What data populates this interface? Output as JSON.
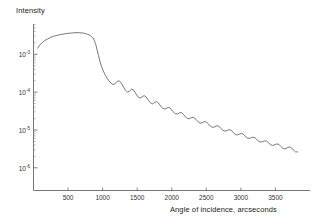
{
  "chart_data": {
    "type": "line",
    "title": "",
    "ylabel": "Intensity",
    "xlabel": "Angle of incidence, arcseconds",
    "xlim": [
      0,
      4000
    ],
    "ylim_log10": [
      -6.6,
      -2.2
    ],
    "grid": false,
    "legend": null,
    "xticks": [
      500,
      1000,
      1500,
      2000,
      2500,
      3000,
      3500
    ],
    "xtick_labels": [
      "500",
      "1000",
      "1500",
      "2000",
      "2500",
      "3000",
      "3500"
    ],
    "yticks_log10": [
      -3,
      -4,
      -5,
      -6
    ],
    "ytick_mantissa": "10",
    "ytick_exponents": [
      "-3",
      "-4",
      "-5",
      "-6"
    ],
    "y_scale": "log",
    "minor_ticks": "log-decade",
    "series": [
      {
        "name": "X-ray reflectivity",
        "color": "#555555",
        "description": "Plateau of total external reflection up to the critical angle near 900 arcsec, then a steep fall-off with regular Kiessig interference fringes decaying toward 4000 arcsec.",
        "x": [
          60,
          90,
          120,
          160,
          200,
          250,
          300,
          360,
          420,
          480,
          540,
          600,
          660,
          720,
          780,
          820,
          860,
          880,
          900,
          920,
          940,
          960,
          980,
          1000,
          1030,
          1060,
          1090,
          1120,
          1150,
          1180,
          1210,
          1240,
          1270,
          1300,
          1330,
          1360,
          1390,
          1420,
          1450,
          1480,
          1510,
          1540,
          1570,
          1600,
          1630,
          1660,
          1690,
          1720,
          1750,
          1780,
          1810,
          1840,
          1870,
          1900,
          1930,
          1960,
          1990,
          2020,
          2050,
          2080,
          2110,
          2140,
          2170,
          2200,
          2230,
          2260,
          2290,
          2320,
          2350,
          2380,
          2410,
          2440,
          2470,
          2500,
          2530,
          2560,
          2590,
          2620,
          2650,
          2680,
          2710,
          2740,
          2770,
          2800,
          2830,
          2860,
          2890,
          2920,
          2950,
          2980,
          3010,
          3040,
          3070,
          3100,
          3130,
          3160,
          3190,
          3220,
          3250,
          3280,
          3310,
          3340,
          3370,
          3400,
          3430,
          3460,
          3490,
          3520,
          3550,
          3580,
          3610,
          3640,
          3670,
          3700,
          3730,
          3760,
          3790,
          3820
        ],
        "y_log10": [
          -2.84,
          -2.76,
          -2.7,
          -2.64,
          -2.6,
          -2.55,
          -2.52,
          -2.49,
          -2.47,
          -2.45,
          -2.44,
          -2.43,
          -2.43,
          -2.44,
          -2.47,
          -2.5,
          -2.57,
          -2.64,
          -2.74,
          -2.88,
          -3.03,
          -3.18,
          -3.3,
          -3.4,
          -3.52,
          -3.62,
          -3.7,
          -3.76,
          -3.8,
          -3.78,
          -3.72,
          -3.7,
          -3.76,
          -3.86,
          -3.95,
          -4.0,
          -3.97,
          -3.92,
          -3.95,
          -4.04,
          -4.12,
          -4.16,
          -4.13,
          -4.09,
          -4.13,
          -4.21,
          -4.28,
          -4.31,
          -4.28,
          -4.25,
          -4.29,
          -4.37,
          -4.43,
          -4.45,
          -4.42,
          -4.4,
          -4.45,
          -4.52,
          -4.57,
          -4.58,
          -4.55,
          -4.54,
          -4.59,
          -4.66,
          -4.7,
          -4.7,
          -4.67,
          -4.67,
          -4.72,
          -4.78,
          -4.82,
          -4.81,
          -4.78,
          -4.79,
          -4.84,
          -4.9,
          -4.93,
          -4.92,
          -4.89,
          -4.9,
          -4.96,
          -5.01,
          -5.03,
          -5.02,
          -4.99,
          -5.01,
          -5.07,
          -5.12,
          -5.13,
          -5.11,
          -5.09,
          -5.12,
          -5.18,
          -5.22,
          -5.22,
          -5.2,
          -5.19,
          -5.23,
          -5.29,
          -5.32,
          -5.31,
          -5.29,
          -5.29,
          -5.34,
          -5.39,
          -5.41,
          -5.39,
          -5.37,
          -5.38,
          -5.44,
          -5.49,
          -5.5,
          -5.47,
          -5.45,
          -5.47,
          -5.53,
          -5.58,
          -5.58,
          -5.54
        ]
      }
    ]
  }
}
